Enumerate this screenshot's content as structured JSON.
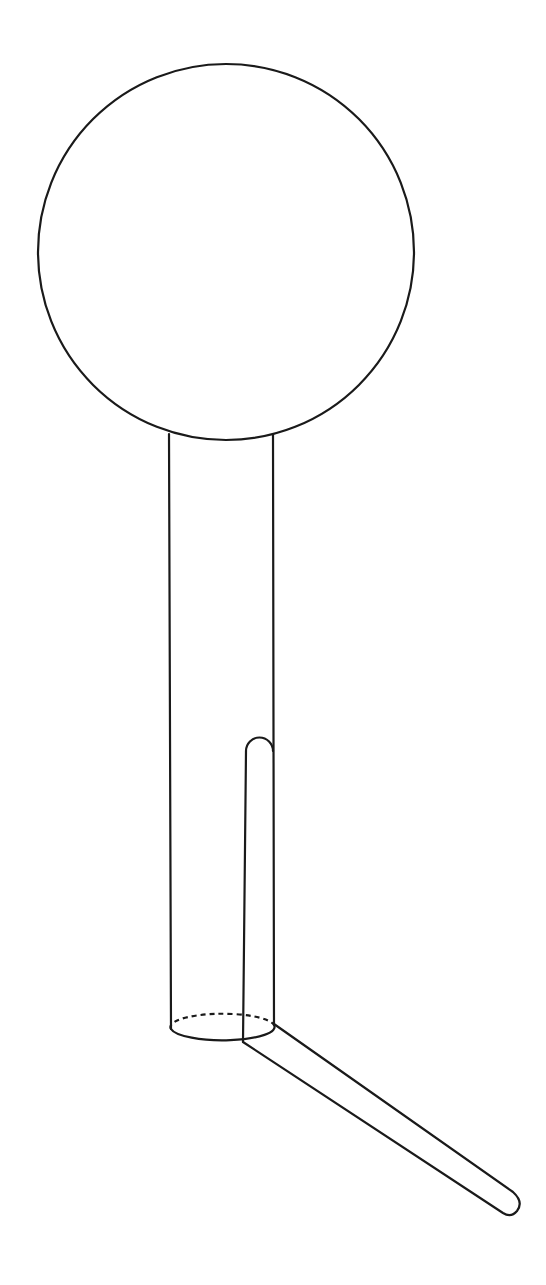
{
  "diagram": {
    "colors": {
      "background": "#ffffff",
      "stroke": "#1a1a1a"
    },
    "parts": [
      {
        "name": "sphere",
        "shape": "circle",
        "cx": 226,
        "cy": 252,
        "r": 188
      },
      {
        "name": "cylinder",
        "shape": "vertical-cylinder",
        "top_left": [
          169,
          436
        ],
        "top_right": [
          273,
          436
        ],
        "bottom_left": [
          171,
          1029
        ],
        "bottom_right": [
          274,
          1025
        ]
      },
      {
        "name": "cylinder-base",
        "shape": "ellipse",
        "cx": 222,
        "cy": 1029,
        "rx": 51,
        "ry": 13,
        "back_half": "dashed"
      },
      {
        "name": "inner-tube",
        "shape": "rounded-vertical-tube",
        "left_x": 246,
        "right_x": 273,
        "top_y": 737,
        "bottom_y": 1042
      },
      {
        "name": "outlet-tube",
        "shape": "rounded-diagonal-tube",
        "upper_edge": [
          [
            274,
            1024
          ],
          [
            515,
            1193
          ]
        ],
        "lower_edge": [
          [
            243,
            1042
          ],
          [
            505,
            1214
          ]
        ]
      }
    ],
    "labels": []
  }
}
